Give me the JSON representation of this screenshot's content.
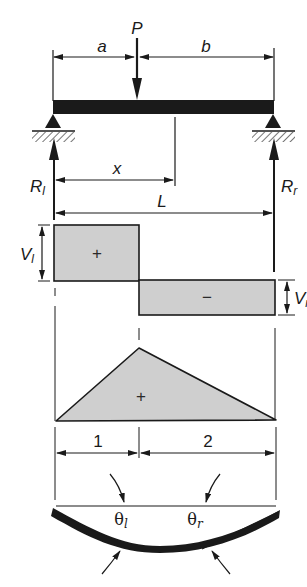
{
  "figure": {
    "colors": {
      "ink": "#1a1a1a",
      "fill": "#cfcfcf",
      "background": "#ffffff"
    }
  },
  "loading": {
    "load_label": "P",
    "dim_a": "a",
    "dim_b": "b",
    "dim_x": "x",
    "dim_L": "L",
    "reaction_left": "R",
    "reaction_left_sub": "l",
    "reaction_right": "R",
    "reaction_right_sub": "r"
  },
  "shear_diagram": {
    "label_left": "V",
    "label_left_sub": "l",
    "label_right": "V",
    "label_right_sub": "r",
    "positive_sign": "+",
    "negative_sign": "−"
  },
  "moment_diagram": {
    "sign": "+",
    "region_1": "1",
    "region_2": "2"
  },
  "deflection": {
    "theta_left": "θ",
    "theta_left_sub": "l",
    "theta_right": "θ",
    "theta_right_sub": "r"
  }
}
